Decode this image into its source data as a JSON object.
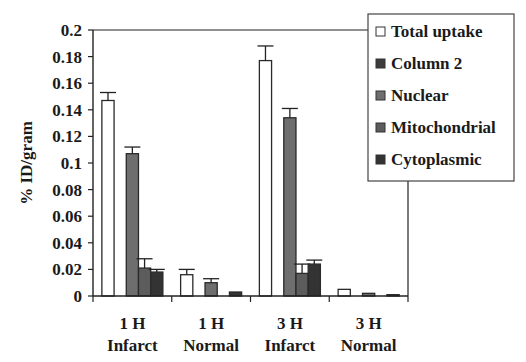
{
  "chart_data": {
    "type": "bar",
    "title": "",
    "xlabel": "",
    "ylabel": "% ID/gram",
    "ylim": [
      0,
      0.2
    ],
    "yticks": [
      0,
      0.02,
      0.04,
      0.06,
      0.08,
      0.1,
      0.12,
      0.14,
      0.16,
      0.18,
      0.2
    ],
    "ytick_labels": [
      "0",
      "0.02",
      "0.04",
      "0.06",
      "0.08",
      "0.1",
      "0.12",
      "0.14",
      "0.16",
      "0.18",
      "0.2"
    ],
    "grid": false,
    "legend_position": "upper-right",
    "categories": [
      {
        "line1": "1 H",
        "line2": "Infarct"
      },
      {
        "line1": "1 H",
        "line2": "Normal"
      },
      {
        "line1": "3 H",
        "line2": "Infarct"
      },
      {
        "line1": "3 H",
        "line2": "Normal"
      }
    ],
    "series": [
      {
        "name": "Total uptake",
        "color": "#ffffff",
        "values": [
          0.147,
          0.016,
          0.177,
          0.005
        ],
        "errors": [
          0.006,
          0.004,
          0.011,
          0.0
        ]
      },
      {
        "name": "Column 2",
        "color": "#3c3c3c",
        "values": [
          0.0,
          0.0,
          0.0,
          0.0
        ],
        "errors": [
          0,
          0,
          0,
          0
        ]
      },
      {
        "name": "Nuclear",
        "color": "#6e6e6e",
        "values": [
          0.107,
          0.01,
          0.134,
          0.002
        ],
        "errors": [
          0.005,
          0.003,
          0.007,
          0.0
        ]
      },
      {
        "name": "Mitochondrial",
        "color": "#5c5c5c",
        "values": [
          0.021,
          0.0,
          0.017,
          0.0
        ],
        "errors": [
          0.007,
          0,
          0.007,
          0
        ]
      },
      {
        "name": "Cytoplasmic",
        "color": "#333333",
        "values": [
          0.018,
          0.003,
          0.024,
          0.001
        ],
        "errors": [
          0.002,
          0,
          0.003,
          0
        ]
      }
    ]
  },
  "legend": {
    "items": [
      "Total uptake",
      "Column 2",
      "Nuclear",
      "Mitochondrial",
      "Cytoplasmic"
    ]
  },
  "axis": {
    "ylabel": "% ID/gram"
  }
}
